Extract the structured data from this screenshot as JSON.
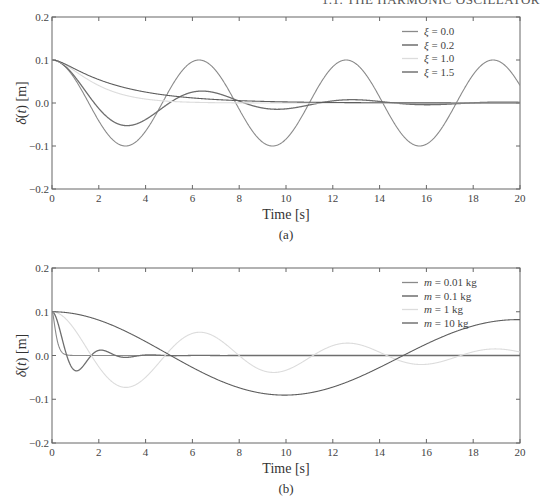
{
  "page": {
    "running_header": "1.1. THE HARMONIC OSCILLATOR"
  },
  "chart_data": [
    {
      "type": "line",
      "caption": "(a)",
      "title": "",
      "xlabel": "Time [s]",
      "ylabel": "δ(t) [m]",
      "xlim": [
        0,
        20
      ],
      "ylim": [
        -0.2,
        0.2
      ],
      "xticks": [
        "0",
        "2",
        "4",
        "6",
        "8",
        "10",
        "12",
        "14",
        "16",
        "18",
        "20"
      ],
      "yticks": [
        "0.2",
        "0.1",
        "0.0",
        "−0.1",
        "−0.2"
      ],
      "grid": false,
      "legend_position": "upper right",
      "model": {
        "x0": 0.1,
        "omega_n": 1.0
      },
      "series": [
        {
          "name": "ξ = 0.0",
          "symbol": "ξ",
          "value": "0.0",
          "zeta": 0.0,
          "color": "#8a8a8a",
          "width": 1.1
        },
        {
          "name": "ξ = 0.2",
          "symbol": "ξ",
          "value": "0.2",
          "zeta": 0.2,
          "color": "#6e6e6e",
          "width": 1.3
        },
        {
          "name": "ξ = 1.0",
          "symbol": "ξ",
          "value": "1.0",
          "zeta": 1.0,
          "color": "#dcdcdc",
          "width": 1.1
        },
        {
          "name": "ξ = 1.5",
          "symbol": "ξ",
          "value": "1.5",
          "zeta": 1.5,
          "color": "#5e5e5e",
          "width": 1.1
        }
      ],
      "sample_points": {
        "t": [
          0,
          2,
          4,
          6,
          8,
          10,
          12,
          14,
          16,
          18,
          20
        ],
        "ξ = 0.0": [
          0.1,
          -0.042,
          -0.065,
          0.096,
          -0.015,
          -0.084,
          0.084,
          0.014,
          -0.096,
          0.066,
          0.041
        ],
        "ξ = 0.2": [
          0.1,
          -0.024,
          -0.035,
          0.025,
          0.003,
          -0.012,
          0.005,
          0.003,
          -0.004,
          0.001,
          0.001
        ],
        "ξ = 1.0": [
          0.1,
          0.041,
          0.009,
          0.002,
          0.0,
          0.0,
          0.0,
          0.0,
          0.0,
          0.0,
          0.0
        ],
        "ξ = 1.5": [
          0.1,
          0.062,
          0.035,
          0.019,
          0.011,
          0.006,
          0.003,
          0.002,
          0.001,
          0.001,
          0.0
        ]
      }
    },
    {
      "type": "line",
      "caption": "(b)",
      "title": "",
      "xlabel": "Time [s]",
      "ylabel": "δ(t) [m]",
      "xlim": [
        0,
        20
      ],
      "ylim": [
        -0.2,
        0.2
      ],
      "xticks": [
        "0",
        "2",
        "4",
        "6",
        "8",
        "10",
        "12",
        "14",
        "16",
        "18",
        "20"
      ],
      "yticks": [
        "0.2",
        "0.1",
        "0.0",
        "−0.1",
        "−0.2"
      ],
      "grid": false,
      "legend_position": "upper right",
      "model": {
        "x0": 0.1,
        "k": 1.0,
        "c": 0.2
      },
      "series": [
        {
          "name": "m = 0.01 kg",
          "symbol": "m",
          "value": "0.01 kg",
          "mass": 0.01,
          "color": "#8a8a8a",
          "width": 1.1
        },
        {
          "name": "m = 0.1 kg",
          "symbol": "m",
          "value": "0.1 kg",
          "mass": 0.1,
          "color": "#6e6e6e",
          "width": 1.3
        },
        {
          "name": "m = 1 kg",
          "symbol": "m",
          "value": "1 kg",
          "mass": 1,
          "color": "#dcdcdc",
          "width": 1.1
        },
        {
          "name": "m = 10 kg",
          "symbol": "m",
          "value": "10 kg",
          "mass": 10,
          "color": "#5e5e5e",
          "width": 1.1
        }
      ],
      "sample_points": {
        "t": [
          0,
          2,
          4,
          6,
          8,
          10,
          12,
          14,
          16,
          18,
          20
        ],
        "m = 0.01 kg": [
          0.1,
          0.0,
          0.0,
          0.0,
          0.0,
          0.0,
          0.0,
          0.0,
          0.0,
          0.0,
          0.0
        ],
        "m = 0.1 kg": [
          0.1,
          0.02,
          0.006,
          0.0,
          0.0,
          0.0,
          0.0,
          0.0,
          0.0,
          0.0,
          0.0
        ],
        "m = 1 kg": [
          0.1,
          -0.024,
          -0.035,
          0.025,
          0.003,
          -0.012,
          0.005,
          0.003,
          -0.004,
          0.001,
          0.001
        ],
        "m = 10 kg": [
          0.1,
          0.08,
          0.03,
          -0.018,
          -0.047,
          -0.054,
          -0.043,
          -0.021,
          0.002,
          0.018,
          0.024
        ]
      }
    }
  ]
}
